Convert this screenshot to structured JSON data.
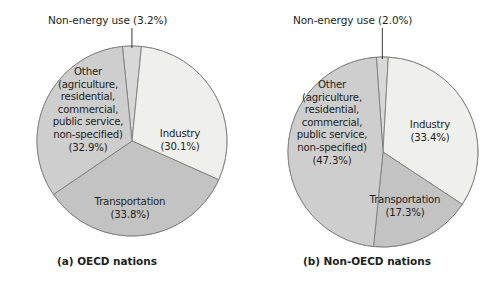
{
  "figure": {
    "panels": [
      {
        "id": "a",
        "caption": "(a) OECD nations",
        "callout_label": "Non-energy use (3.2%)",
        "center": {
          "x": 132,
          "y": 141
        },
        "radius": 95,
        "slices": [
          {
            "name": "Non-energy use",
            "percent": 3.2,
            "label": "Non-energy use",
            "value_label": "(3.2%)",
            "color": "#d8d8d8",
            "inside_label": false
          },
          {
            "name": "Industry",
            "percent": 30.1,
            "label": "Industry",
            "value_label": "(30.1%)",
            "color": "#efefed",
            "inside_label": true
          },
          {
            "name": "Transportation",
            "percent": 33.8,
            "label": "Transportation",
            "value_label": "(33.8%)",
            "color": "#c3c3c3",
            "inside_label": true
          },
          {
            "name": "Other",
            "percent": 32.9,
            "label": "Other",
            "value_label": "(32.9%)",
            "color": "#cecece",
            "inside_label": true
          }
        ],
        "other_lines": [
          "Other",
          "(agriculture,",
          "residential,",
          "commercial,",
          "public service,",
          "non-specified)",
          "(32.9%)"
        ],
        "industry_lines": [
          "Industry",
          "(30.1%)"
        ],
        "transportation_lines": [
          "Transportation",
          "(33.8%)"
        ]
      },
      {
        "id": "b",
        "caption": "(b) Non-OECD nations",
        "callout_label": "Non-energy use (2.0%)",
        "center": {
          "x": 383,
          "y": 152
        },
        "radius": 95,
        "slices": [
          {
            "name": "Non-energy use",
            "percent": 2.0,
            "label": "Non-energy use",
            "value_label": "(2.0%)",
            "color": "#d8d8d8",
            "inside_label": false
          },
          {
            "name": "Industry",
            "percent": 33.4,
            "label": "Industry",
            "value_label": "(33.4%)",
            "color": "#efefed",
            "inside_label": true
          },
          {
            "name": "Transportation",
            "percent": 17.3,
            "label": "Transportation",
            "value_label": "(17.3%)",
            "color": "#c3c3c3",
            "inside_label": true
          },
          {
            "name": "Other",
            "percent": 47.3,
            "label": "Other",
            "value_label": "(47.3%)",
            "color": "#cecece",
            "inside_label": true
          }
        ],
        "other_lines": [
          "Other",
          "(agriculture,",
          "residential,",
          "commercial,",
          "public service,",
          "non-specified)",
          "(47.3%)"
        ],
        "industry_lines": [
          "Industry",
          "(33.4%)"
        ],
        "transportation_lines": [
          "Transportation",
          "(17.3%)"
        ]
      }
    ]
  },
  "chart_data": [
    {
      "type": "pie",
      "title": "(a) OECD nations",
      "categories": [
        "Non-energy use",
        "Industry",
        "Transportation",
        "Other (agriculture, residential, commercial, public service, non-specified)"
      ],
      "values": [
        3.2,
        30.1,
        33.8,
        32.9
      ],
      "unit": "percent",
      "colors": [
        "#d8d8d8",
        "#efefed",
        "#c3c3c3",
        "#cecece"
      ],
      "annotations": [
        "Non-energy use (3.2%)"
      ],
      "legend": "none",
      "start_angle_deg": -6,
      "direction": "clockwise"
    },
    {
      "type": "pie",
      "title": "(b) Non-OECD nations",
      "categories": [
        "Non-energy use",
        "Industry",
        "Transportation",
        "Other (agriculture, residential, commercial, public service, non-specified)"
      ],
      "values": [
        2.0,
        33.4,
        17.3,
        47.3
      ],
      "unit": "percent",
      "colors": [
        "#d8d8d8",
        "#efefed",
        "#c3c3c3",
        "#cecece"
      ],
      "annotations": [
        "Non-energy use (2.0%)"
      ],
      "legend": "none",
      "start_angle_deg": -4,
      "direction": "clockwise"
    }
  ]
}
